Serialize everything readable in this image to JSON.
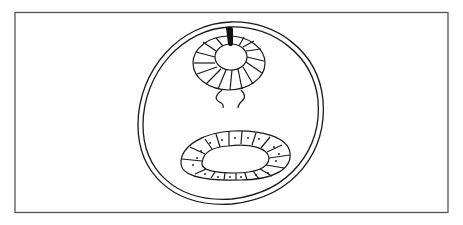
{
  "diagram": {
    "type": "biological-cross-section",
    "colors": {
      "line": "#1a1a1a",
      "frame": "#555555",
      "background": "#ffffff",
      "fill": "#111111"
    },
    "parts": [
      {
        "id": "frame",
        "label": ""
      },
      {
        "id": "body-wall",
        "label": ""
      },
      {
        "id": "neural-tube",
        "label": ""
      },
      {
        "id": "dorsal-mark",
        "label": ""
      },
      {
        "id": "ventral-stalk",
        "label": ""
      },
      {
        "id": "gut-tube",
        "label": ""
      }
    ],
    "labels": []
  }
}
